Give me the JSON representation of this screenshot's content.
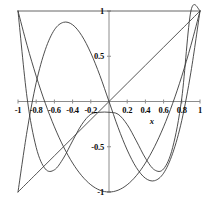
{
  "chart_data": {
    "type": "line",
    "title": "",
    "subtitle": "",
    "xlabel": "x",
    "ylabel": "",
    "xlim": [
      -1,
      1
    ],
    "ylim": [
      -1,
      1
    ],
    "grid": false,
    "legend": "none",
    "annotations": [
      {
        "text": "x",
        "x": 0.47,
        "y": -0.22,
        "style": "italic"
      }
    ],
    "x_ticks": [
      {
        "value": -1,
        "label": "-1"
      },
      {
        "value": -0.8,
        "label": "-0.8"
      },
      {
        "value": -0.6,
        "label": "-0.6"
      },
      {
        "value": -0.4,
        "label": "-0.4"
      },
      {
        "value": -0.2,
        "label": "-0.2"
      },
      {
        "value": 0.2,
        "label": "0.2"
      },
      {
        "value": 0.4,
        "label": "0.4"
      },
      {
        "value": 0.6,
        "label": "0.6"
      },
      {
        "value": 0.8,
        "label": "0.8"
      },
      {
        "value": 1,
        "label": "1"
      }
    ],
    "y_ticks": [
      {
        "value": 1,
        "label": "1"
      },
      {
        "value": 0.5,
        "label": "0.5"
      },
      {
        "value": -0.5,
        "label": "-0.5"
      },
      {
        "value": -1,
        "label": "-1"
      }
    ],
    "series": [
      {
        "name": "T0",
        "color": "#555555",
        "linestyle": "solid",
        "x": [
          -1,
          1
        ],
        "values": [
          1,
          1
        ]
      },
      {
        "name": "T1",
        "color": "#444444",
        "linestyle": "solid",
        "x": [
          -1,
          -0.8,
          -0.6,
          -0.4,
          -0.2,
          0,
          0.2,
          0.4,
          0.6,
          0.8,
          1
        ],
        "values": [
          -1,
          -0.8,
          -0.6,
          -0.4,
          -0.2,
          0,
          0.2,
          0.4,
          0.6,
          0.8,
          1
        ]
      },
      {
        "name": "T2",
        "color": "#3a3a3a",
        "linestyle": "solid",
        "x": [
          -1,
          -0.9,
          -0.8,
          -0.7,
          -0.6,
          -0.5,
          -0.4,
          -0.3,
          -0.2,
          -0.1,
          0,
          0.1,
          0.2,
          0.3,
          0.4,
          0.5,
          0.6,
          0.7,
          0.8,
          0.9,
          1
        ],
        "values": [
          1,
          0.62,
          0.28,
          -0.02,
          -0.28,
          -0.5,
          -0.68,
          -0.82,
          -0.92,
          -0.98,
          -1,
          -0.98,
          -0.92,
          -0.82,
          -0.68,
          -0.5,
          -0.28,
          -0.02,
          0.28,
          0.62,
          1
        ]
      },
      {
        "name": "T3",
        "color": "#3a3a3a",
        "linestyle": "solid",
        "x": [
          -1,
          -0.9,
          -0.8,
          -0.7,
          -0.6,
          -0.5,
          -0.4,
          -0.3,
          -0.2,
          -0.1,
          0,
          0.1,
          0.2,
          0.3,
          0.4,
          0.5,
          0.6,
          0.7,
          0.8,
          0.9,
          1
        ],
        "values": [
          -1,
          -0.324,
          0.208,
          0.572,
          0.792,
          0.875,
          0.848,
          0.729,
          0.536,
          0.287,
          0,
          -0.287,
          -0.536,
          -0.729,
          -0.848,
          -0.875,
          -0.792,
          -0.572,
          -0.208,
          0.324,
          1
        ]
      },
      {
        "name": "T4",
        "color": "#3a3a3a",
        "linestyle": "solid",
        "x": [
          -1,
          -0.9,
          -0.8,
          -0.7,
          -0.6,
          -0.5,
          -0.4,
          -0.3,
          -0.2,
          -0.1,
          0,
          0.1,
          0.2,
          0.3,
          0.4,
          0.5,
          0.6,
          0.7,
          0.8,
          0.9,
          1
        ],
        "values": [
          1,
          0.0392,
          -0.5072,
          -0.7448,
          -0.7552,
          -0.625,
          -0.4352,
          -0.2552,
          -0.1408,
          -0.1192,
          -0.1192,
          -0.1408,
          -0.2552,
          -0.4352,
          -0.625,
          -0.7552,
          -0.7448,
          -0.5072,
          0.0392,
          1,
          1
        ]
      }
    ]
  },
  "axes_geometry": {
    "x_pixel_min": 18,
    "x_pixel_max": 200,
    "y_pixel_min": 11,
    "y_pixel_max": 192,
    "origin_x": 109,
    "origin_y": 101.5
  },
  "colors": {
    "axis": "#8c8c8c",
    "curve": "#3a3a3a",
    "text": "#0a0a0a",
    "background": "#ffffff"
  }
}
